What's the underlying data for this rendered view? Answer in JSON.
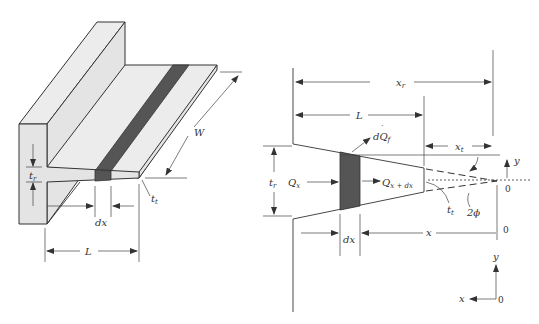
{
  "figure": {
    "left_panel": {
      "name": "Isometric view of tapered fin on wall",
      "labels": {
        "root_thickness": "t",
        "root_thickness_sub": "r",
        "tip_thickness": "t",
        "tip_thickness_sub": "t",
        "element_width": "dx",
        "fin_length": "L",
        "fin_width": "W"
      }
    },
    "right_panel": {
      "name": "Cross-section of tapered fin",
      "labels": {
        "root_distance": "x",
        "root_distance_sub": "r",
        "fin_length": "L",
        "tip_distance": "x",
        "tip_distance_sub": "t",
        "fin_heat_loss": "dQ",
        "fin_heat_loss_sub": "f",
        "heat_in": "Q",
        "heat_in_sub": "x",
        "heat_out": "Q",
        "heat_out_sub": "x + dx",
        "root_thickness": "t",
        "root_thickness_sub": "r",
        "tip_thickness": "t",
        "tip_thickness_sub": "t",
        "angle": "2ϕ",
        "element_width": "dx",
        "position": "x",
        "y_axis_top": "y",
        "origin_top": "0",
        "origin_mid": "0",
        "axes_y": "y",
        "axes_x": "x",
        "axes_origin": "0"
      }
    },
    "colors": {
      "line": "#333333",
      "fin_fill": "#e4e4e4",
      "element_fill": "#555555",
      "background": "#ffffff"
    }
  }
}
